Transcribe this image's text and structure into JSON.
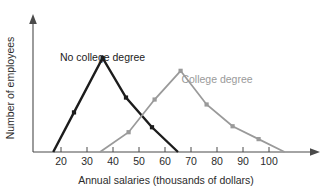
{
  "chart_data": {
    "type": "line",
    "title": "",
    "xlabel": "Annual salaries (thousands of dollars)",
    "ylabel": "Number of employees",
    "xlim": [
      12,
      112
    ],
    "ylim": [
      0,
      100
    ],
    "xticks": [
      20,
      30,
      40,
      50,
      60,
      70,
      80,
      90,
      100
    ],
    "xtick_labels": [
      "20",
      "30",
      "40",
      "50",
      "60",
      "70",
      "80",
      "90",
      "100"
    ],
    "yticks": [],
    "ytick_labels": [],
    "grid": false,
    "legend_position": "inline-annotation",
    "series": [
      {
        "name": "No college degree",
        "color": "#1c1c1c",
        "label_x": 36,
        "label_y": 92,
        "x": [
          17,
          25,
          36,
          45,
          55,
          65
        ],
        "y": [
          0,
          40,
          95,
          55,
          25,
          0
        ]
      },
      {
        "name": "College degree",
        "color": "#9a9a9a",
        "label_x": 80,
        "label_y": 70,
        "x": [
          35,
          46,
          56,
          66,
          76,
          86,
          96,
          106
        ],
        "y": [
          0,
          20,
          53,
          82,
          48,
          26,
          13,
          0
        ]
      }
    ],
    "annotations": [
      {
        "text": "No college degree",
        "series": "No college degree"
      },
      {
        "text": "College degree",
        "series": "College degree"
      }
    ]
  },
  "colors": {
    "no_college_degree": "#1c1c1c",
    "college_degree": "#9a9a9a",
    "axis": "#4a4a4a",
    "text": "#2b2b2b",
    "background": "#ffffff"
  }
}
